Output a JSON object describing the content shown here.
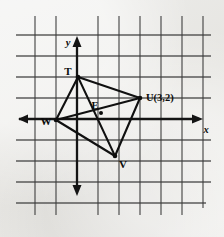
{
  "figure": {
    "background_color": "#e8e7e3",
    "ink_color": "#101010",
    "grid_color": "#3b3b3b"
  },
  "axes": {
    "x_label": "x",
    "y_label": "y",
    "x_axis_name": "horizontal-axis",
    "y_axis_name": "vertical-axis",
    "x_arrow_left": "arrow-left-icon",
    "x_arrow_right": "arrow-right-icon",
    "y_arrow_up": "arrow-up-icon",
    "y_arrow_down": "arrow-down-icon"
  },
  "grid": {
    "spacing_px": 21,
    "vertical_x": [
      35,
      56,
      77,
      98,
      119,
      140,
      161,
      182,
      203
    ],
    "horizontal_y": [
      35,
      56,
      77,
      98,
      119,
      140,
      161,
      182,
      203
    ],
    "left": 16,
    "right": 211,
    "top": 16,
    "bottom": 215,
    "origin_x": 77,
    "origin_y": 119
  },
  "points": [
    {
      "id": "T",
      "label": "T",
      "px": 78,
      "py": 77,
      "label_x": 68,
      "label_y": 75,
      "graph_x": 0,
      "graph_y": 2
    },
    {
      "id": "U",
      "label": "U(3,2)",
      "px": 140,
      "py": 98,
      "label_x": 146,
      "label_y": 98,
      "graph_x": 3,
      "graph_y": 1
    },
    {
      "id": "V",
      "label": "V",
      "px": 115,
      "py": 156,
      "label_x": 119,
      "label_y": 166,
      "graph_x": 2,
      "graph_y": -2
    },
    {
      "id": "W",
      "label": "W",
      "px": 56,
      "py": 120,
      "label_x": 45,
      "label_y": 124,
      "graph_x": -1,
      "graph_y": 0
    },
    {
      "id": "E",
      "label": "E",
      "px": 101,
      "py": 113,
      "label_x": 95,
      "label_y": 108,
      "graph_x": 1,
      "graph_y": 0
    }
  ],
  "edges": [
    {
      "name": "edge-T-U",
      "from": "T",
      "to": "U"
    },
    {
      "name": "edge-U-V",
      "from": "U",
      "to": "V"
    },
    {
      "name": "edge-V-W",
      "from": "V",
      "to": "W"
    },
    {
      "name": "edge-W-T",
      "from": "W",
      "to": "T"
    }
  ],
  "diagonals": [
    {
      "name": "diagonal-T-V",
      "from": "T",
      "to": "V"
    },
    {
      "name": "diagonal-U-W",
      "from": "U",
      "to": "W"
    }
  ]
}
